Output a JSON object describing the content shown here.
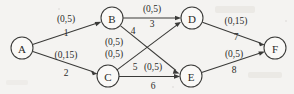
{
  "figure": {
    "kind": "network-flow-diagram",
    "width": 294,
    "height": 94,
    "background_color": "#f4f3f1",
    "ink_color": "#2b2b29"
  },
  "nodes": [
    {
      "id": "A",
      "label": "A",
      "cx": 22,
      "cy": 48,
      "r": 11
    },
    {
      "id": "B",
      "label": "B",
      "cx": 112,
      "cy": 18,
      "r": 11
    },
    {
      "id": "C",
      "label": "C",
      "cx": 108,
      "cy": 76,
      "r": 11
    },
    {
      "id": "D",
      "label": "D",
      "cx": 192,
      "cy": 18,
      "r": 11
    },
    {
      "id": "E",
      "label": "E",
      "cx": 191,
      "cy": 76,
      "r": 11
    },
    {
      "id": "F",
      "label": "F",
      "cx": 275,
      "cy": 48,
      "r": 11
    }
  ],
  "edges": [
    {
      "id": "e1",
      "from": "A",
      "to": "B",
      "capacity": "(0,5)",
      "index": "1",
      "cap_x": 66,
      "cap_y": 22,
      "idx_x": 66,
      "idx_y": 36
    },
    {
      "id": "e2",
      "from": "A",
      "to": "C",
      "capacity": "(0,15)",
      "index": "2",
      "cap_x": 66,
      "cap_y": 58,
      "idx_x": 66,
      "idx_y": 76
    },
    {
      "id": "e3",
      "from": "B",
      "to": "D",
      "capacity": "(0,5)",
      "index": "3",
      "cap_x": 152,
      "cap_y": 12,
      "idx_x": 152,
      "idx_y": 27
    },
    {
      "id": "e4",
      "from": "B",
      "to": "E",
      "capacity": "(0,5)",
      "index": "4",
      "cap_x": 114,
      "cap_y": 45,
      "idx_x": 133,
      "idx_y": 34
    },
    {
      "id": "e5",
      "from": "C",
      "to": "D",
      "capacity": "(0,5)",
      "index": "5",
      "cap_x": 114,
      "cap_y": 57,
      "idx_x": 135,
      "idx_y": 70
    },
    {
      "id": "e6",
      "from": "C",
      "to": "E",
      "capacity": "(0,5)",
      "index": "6",
      "cap_x": 153,
      "cap_y": 70,
      "idx_x": 153,
      "idx_y": 89
    },
    {
      "id": "e7",
      "from": "D",
      "to": "F",
      "capacity": "(0,15)",
      "index": "7",
      "cap_x": 236,
      "cap_y": 24,
      "idx_x": 236,
      "idx_y": 40
    },
    {
      "id": "e8",
      "from": "E",
      "to": "F",
      "capacity": "(0,5)",
      "index": "8",
      "cap_x": 234,
      "cap_y": 57,
      "idx_x": 234,
      "idx_y": 73
    }
  ]
}
